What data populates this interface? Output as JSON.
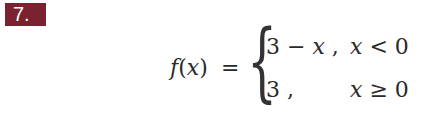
{
  "problem": {
    "number_label": "7.",
    "badge_color": "#7a2230"
  },
  "equation": {
    "lhs_fn": "f",
    "lhs_open": "(",
    "lhs_var": "x",
    "lhs_close": ")",
    "equals": "=",
    "brace": "{",
    "cases": [
      {
        "expr_num": "3",
        "expr_op": " − ",
        "expr_var": "x",
        "comma": " ,",
        "cond_var": "x",
        "cond_rel": " < ",
        "cond_val": "0"
      },
      {
        "expr_num": "3",
        "expr_op": "",
        "expr_var": "",
        "comma": " ,",
        "cond_var": "x",
        "cond_rel": " ≥ ",
        "cond_val": "0"
      }
    ]
  }
}
